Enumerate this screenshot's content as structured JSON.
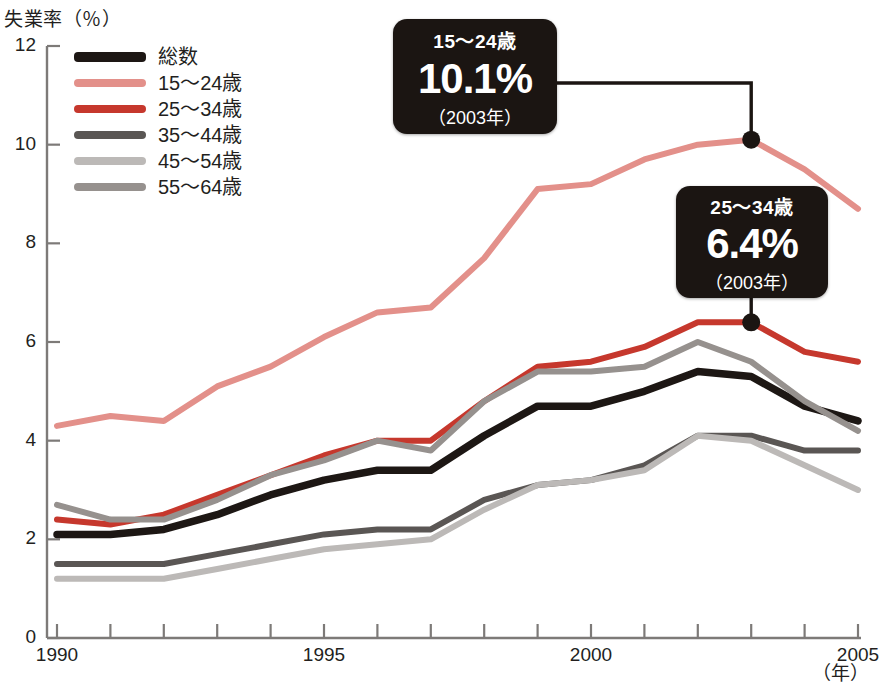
{
  "chart_data": {
    "type": "line",
    "title": "",
    "ylabel": "失業率（％）",
    "xlabel": "（年）",
    "xlim": [
      1990,
      2005
    ],
    "ylim": [
      0,
      12
    ],
    "ytick_labels": [
      "0",
      "2",
      "4",
      "6",
      "8",
      "10",
      "12"
    ],
    "ytick_values": [
      0,
      2,
      4,
      6,
      8,
      10,
      12
    ],
    "xtick_labels": [
      "1990",
      "1995",
      "2000",
      "2005"
    ],
    "xtick_values": [
      1990,
      1995,
      2000,
      2005
    ],
    "grid": false,
    "legend_position": "top-left",
    "x": [
      1990,
      1991,
      1992,
      1993,
      1994,
      1995,
      1996,
      1997,
      1998,
      1999,
      2000,
      2001,
      2002,
      2003,
      2004,
      2005
    ],
    "series": [
      {
        "name": "総数",
        "color": "#1d1714",
        "values": [
          2.1,
          2.1,
          2.2,
          2.5,
          2.9,
          3.2,
          3.4,
          3.4,
          4.1,
          4.7,
          4.7,
          5.0,
          5.4,
          5.3,
          4.7,
          4.4
        ]
      },
      {
        "name": "15〜24歳",
        "color": "#e3908a",
        "values": [
          4.3,
          4.5,
          4.4,
          5.1,
          5.5,
          6.1,
          6.6,
          6.7,
          7.7,
          9.1,
          9.2,
          9.7,
          10.0,
          10.1,
          9.5,
          8.7
        ]
      },
      {
        "name": "25〜34歳",
        "color": "#c6382d",
        "values": [
          2.4,
          2.3,
          2.5,
          2.9,
          3.3,
          3.7,
          4.0,
          4.0,
          4.8,
          5.5,
          5.6,
          5.9,
          6.4,
          6.4,
          5.8,
          5.6
        ]
      },
      {
        "name": "35〜44歳",
        "color": "#5a5654",
        "values": [
          1.5,
          1.5,
          1.5,
          1.7,
          1.9,
          2.1,
          2.2,
          2.2,
          2.8,
          3.1,
          3.2,
          3.5,
          4.1,
          4.1,
          3.8,
          3.8
        ]
      },
      {
        "name": "45〜54歳",
        "color": "#bcb9b7",
        "values": [
          1.2,
          1.2,
          1.2,
          1.4,
          1.6,
          1.8,
          1.9,
          2.0,
          2.6,
          3.1,
          3.2,
          3.4,
          4.1,
          4.0,
          3.5,
          3.0
        ]
      },
      {
        "name": "55〜64歳",
        "color": "#96918e",
        "values": [
          2.7,
          2.4,
          2.4,
          2.8,
          3.3,
          3.6,
          4.0,
          3.8,
          4.8,
          5.4,
          5.4,
          5.5,
          6.0,
          5.6,
          4.8,
          4.2
        ]
      }
    ],
    "annotations": [
      {
        "id": "callout-1524",
        "age_group": "15〜24歳",
        "value": "10.1%",
        "year": "（2003年）",
        "point": {
          "x": 2003,
          "y": 10.1
        },
        "series": "15〜24歳"
      },
      {
        "id": "callout-2534",
        "age_group": "25〜34歳",
        "value": "6.4%",
        "year": "（2003年）",
        "point": {
          "x": 2003,
          "y": 6.4
        },
        "series": "25〜34歳"
      }
    ]
  },
  "axis": {
    "y_title": "失業率（％）",
    "x_unit": "（年）",
    "y_ticks": [
      {
        "label": "12"
      },
      {
        "label": "10"
      },
      {
        "label": "8"
      },
      {
        "label": "6"
      },
      {
        "label": "4"
      },
      {
        "label": "2"
      },
      {
        "label": "0"
      }
    ],
    "x_ticks": [
      {
        "label": "1990"
      },
      {
        "label": "1995"
      },
      {
        "label": "2000"
      },
      {
        "label": "2005"
      }
    ]
  },
  "legend": {
    "items": [
      {
        "label": "総数",
        "color": "#1d1714"
      },
      {
        "label": "15〜24歳",
        "color": "#e3908a"
      },
      {
        "label": "25〜34歳",
        "color": "#c6382d"
      },
      {
        "label": "35〜44歳",
        "color": "#5a5654"
      },
      {
        "label": "45〜54歳",
        "color": "#bcb9b7"
      },
      {
        "label": "55〜64歳",
        "color": "#96918e"
      }
    ]
  },
  "callouts": {
    "first": {
      "age": "15〜24歳",
      "value": "10.1%",
      "year": "（2003年）"
    },
    "second": {
      "age": "25〜34歳",
      "value": "6.4%",
      "year": "（2003年）"
    }
  },
  "colors": {
    "axis": "#7d7a78",
    "callout_bg": "#1b1512",
    "text": "#231f1e"
  }
}
